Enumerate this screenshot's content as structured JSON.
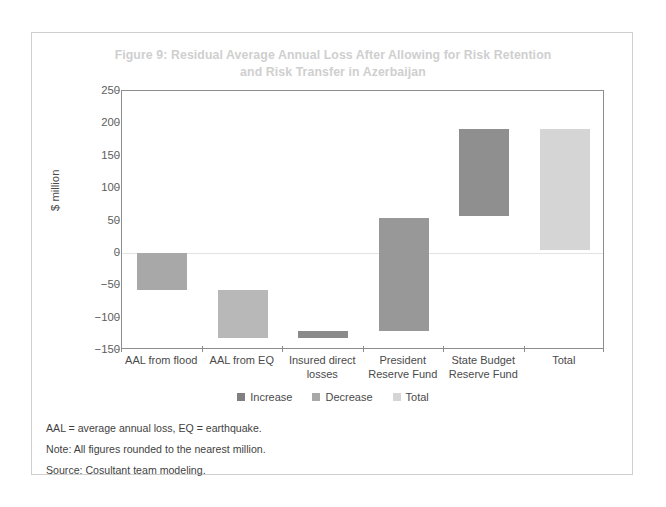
{
  "figure": {
    "title_line1": "Figure 9: Residual Average Annual Loss After Allowing for Risk Retention",
    "title_line2": "and Risk Transfer in Azerbaijan",
    "title_color": "#cfcfcf"
  },
  "notes": [
    "AAL = average annual loss, EQ = earthquake.",
    "Note: All figures rounded to the nearest million.",
    "Source: Cosultant team modeling."
  ],
  "legend": {
    "items": [
      {
        "label": "Increase",
        "color": "#808080"
      },
      {
        "label": "Decrease",
        "color": "#a8a8a8"
      },
      {
        "label": "Total",
        "color": "#d5d5d5"
      }
    ]
  },
  "chart_data": {
    "type": "bar",
    "subtype": "waterfall",
    "title": "Figure 9: Residual Average Annual Loss After Allowing for Risk Retention and Risk Transfer in Azerbaijan",
    "xlabel": "",
    "ylabel": "$ million",
    "ylim": [
      -150,
      250
    ],
    "yticks": [
      250,
      200,
      150,
      100,
      50,
      0,
      -50,
      -100,
      -150
    ],
    "ytick_labels": [
      "250",
      "200",
      "150",
      "100",
      "50",
      "0",
      "−50",
      "−100",
      "−150"
    ],
    "grid": false,
    "legend_position": "bottom-center",
    "categories": [
      "AAL from flood",
      "AAL from EQ",
      "Insured direct losses",
      "President Reserve Fund",
      "State Budget Reserve Fund",
      "Total"
    ],
    "category_lines": [
      [
        "AAL from flood"
      ],
      [
        "AAL from EQ"
      ],
      [
        "Insured direct",
        "losses"
      ],
      [
        "President",
        "Reserve Fund"
      ],
      [
        "State Budget",
        "Reserve Fund"
      ],
      [
        "Total"
      ]
    ],
    "bars": [
      {
        "category": "AAL from flood",
        "start": 0,
        "end": -58,
        "delta": -58,
        "series": "Decrease",
        "color": "#a8a8a8"
      },
      {
        "category": "AAL from EQ",
        "start": -58,
        "end": -131,
        "delta": -73,
        "series": "Decrease",
        "color": "#b8b8b8"
      },
      {
        "category": "Insured direct losses",
        "start": -131,
        "end": -121,
        "delta": 10,
        "series": "Increase",
        "color": "#8a8a8a"
      },
      {
        "category": "President Reserve Fund",
        "start": -121,
        "end": 54,
        "delta": 175,
        "series": "Increase",
        "color": "#989898"
      },
      {
        "category": "State Budget Reserve Fund",
        "start": 57,
        "end": 191,
        "delta": 134,
        "series": "Increase",
        "color": "#8f8f8f"
      },
      {
        "category": "Total",
        "start": 5,
        "end": 191,
        "delta": 186,
        "series": "Total",
        "color": "#d5d5d5"
      }
    ]
  }
}
